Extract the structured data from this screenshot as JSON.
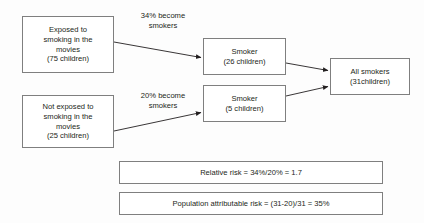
{
  "diagram": {
    "background_color": "#fdfdfd",
    "box_border_color": "#7f7f7f",
    "text_color": "#231f20",
    "nodes": {
      "exposed": {
        "line1": "Exposed to",
        "line2": "smoking in the",
        "line3": "movies",
        "line4": "(75 children)"
      },
      "not_exposed": {
        "line1": "Not exposed to",
        "line2": "smoking in the",
        "line3": "movies",
        "line4": "(25 children)"
      },
      "smoker_exposed": {
        "line1": "Smoker",
        "line2": "(26 children)"
      },
      "smoker_not_exposed": {
        "line1": "Smoker",
        "line2": "(5 children)"
      },
      "all_smokers": {
        "line1": "All smokers",
        "line2": "(31children)"
      },
      "relative_risk": {
        "text": "Relative risk = 34%/20% = 1.7"
      },
      "population_attributable_risk": {
        "text": "Population attributable risk = (31-20)/31 = 35%"
      }
    },
    "edge_labels": {
      "exposed_rate": {
        "line1": "34% become",
        "line2": "smokers"
      },
      "not_exposed_rate": {
        "line1": "20% become",
        "line2": "smokers"
      }
    }
  }
}
